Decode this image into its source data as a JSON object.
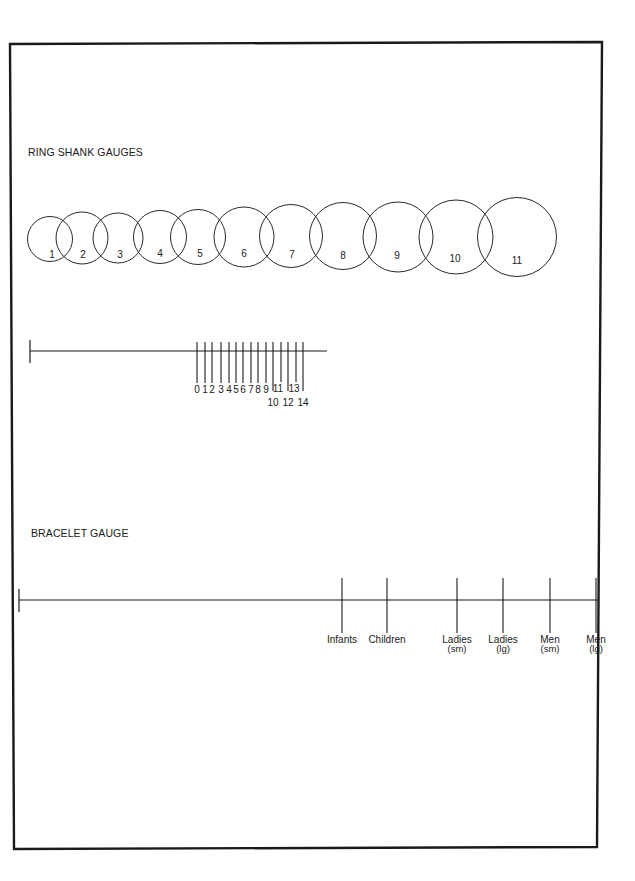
{
  "page": {
    "frame": {
      "points": [
        [
          10,
          44
        ],
        [
          602,
          42
        ],
        [
          597,
          847
        ],
        [
          14,
          849
        ]
      ],
      "stroke": "#1a1a1a"
    }
  },
  "ring_shank": {
    "title": "RING SHANK GAUGES",
    "title_pos": [
      28,
      156
    ],
    "circles": [
      {
        "label": "1",
        "cx": 50,
        "cy": 239,
        "r": 22.5,
        "lx": 52,
        "ly": 258
      },
      {
        "label": "2",
        "cx": 82,
        "cy": 238,
        "r": 26,
        "lx": 83,
        "ly": 258
      },
      {
        "label": "3",
        "cx": 118,
        "cy": 238,
        "r": 25,
        "lx": 120,
        "ly": 258
      },
      {
        "label": "4",
        "cx": 160,
        "cy": 237,
        "r": 26.5,
        "lx": 160,
        "ly": 257
      },
      {
        "label": "5",
        "cx": 198,
        "cy": 237,
        "r": 27.5,
        "lx": 200,
        "ly": 257
      },
      {
        "label": "6",
        "cx": 244,
        "cy": 237,
        "r": 30,
        "lx": 244,
        "ly": 257
      },
      {
        "label": "7",
        "cx": 291,
        "cy": 236,
        "r": 31.5,
        "lx": 292,
        "ly": 258
      },
      {
        "label": "8",
        "cx": 343,
        "cy": 236,
        "r": 33.5,
        "lx": 343,
        "ly": 259
      },
      {
        "label": "9",
        "cx": 398,
        "cy": 237,
        "r": 35,
        "lx": 397,
        "ly": 259
      },
      {
        "label": "10",
        "cx": 456,
        "cy": 237,
        "r": 37,
        "lx": 455,
        "ly": 262
      },
      {
        "label": "11",
        "cx": 517,
        "cy": 237,
        "r": 39.5,
        "lx": 517,
        "ly": 264
      }
    ]
  },
  "ring_ruler": {
    "line": {
      "x1": 30,
      "x2": 327,
      "y": 351
    },
    "endcap": {
      "x": 30,
      "y1": 340,
      "y2": 363
    },
    "tick_top": 342,
    "ticks": [
      {
        "label": "0",
        "x": 197,
        "bottom": 383,
        "ly": 393
      },
      {
        "label": "1",
        "x": 205,
        "bottom": 383,
        "ly": 393
      },
      {
        "label": "2",
        "x": 212,
        "bottom": 383,
        "ly": 393
      },
      {
        "label": "3",
        "x": 221,
        "bottom": 383,
        "ly": 393
      },
      {
        "label": "4",
        "x": 229,
        "bottom": 383,
        "ly": 393
      },
      {
        "label": "5",
        "x": 236,
        "bottom": 383,
        "ly": 393
      },
      {
        "label": "6",
        "x": 243,
        "bottom": 383,
        "ly": 393
      },
      {
        "label": "7",
        "x": 251,
        "bottom": 383,
        "ly": 393
      },
      {
        "label": "8",
        "x": 258,
        "bottom": 383,
        "ly": 393
      },
      {
        "label": "9",
        "x": 266,
        "bottom": 383,
        "ly": 393
      },
      {
        "label": "10",
        "x": 273,
        "bottom": 391,
        "ly": 406
      },
      {
        "label": "11",
        "x": 281,
        "bottom": 382,
        "ly": 392,
        "lx": 278
      },
      {
        "label": "12",
        "x": 288,
        "bottom": 391,
        "ly": 406
      },
      {
        "label": "13",
        "x": 296,
        "bottom": 382,
        "ly": 392,
        "lx": 294
      },
      {
        "label": "14",
        "x": 303,
        "bottom": 391,
        "ly": 406
      }
    ]
  },
  "bracelet": {
    "title": "BRACELET GAUGE",
    "title_pos": [
      31,
      537
    ],
    "line": {
      "x1": 19,
      "x2": 599,
      "y": 600
    },
    "endcap": {
      "x": 19,
      "y1": 589,
      "y2": 612
    },
    "tick_top": 578,
    "tick_bottom": 633,
    "ticks": [
      {
        "label": "Infants",
        "sub": "",
        "x": 342
      },
      {
        "label": "Children",
        "sub": "",
        "x": 387
      },
      {
        "label": "Ladies",
        "sub": "(sm)",
        "x": 457
      },
      {
        "label": "Ladies",
        "sub": "(lg)",
        "x": 503
      },
      {
        "label": "Men",
        "sub": "(sm)",
        "x": 550
      },
      {
        "label": "Men",
        "sub": "(lg)",
        "x": 596
      }
    ],
    "label_y": 643,
    "sub_y": 652
  }
}
